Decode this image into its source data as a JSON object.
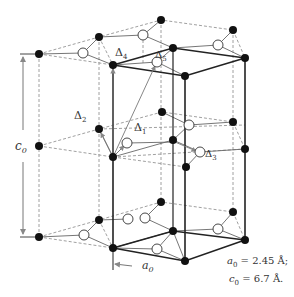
{
  "diagram": {
    "type": "graphite crystal structure (hexagonal unit cell)",
    "labels": {
      "delta1": "Δ",
      "delta1_sub": "1",
      "delta2": "Δ",
      "delta2_sub": "2",
      "delta3": "Δ",
      "delta3_sub": "3",
      "delta4": "Δ",
      "delta4_sub": "4",
      "delta5": "Δ",
      "delta5_sub": "5",
      "c0": "c",
      "c0_sub": "0",
      "a0": "a",
      "a0_sub": "0"
    },
    "constants": {
      "a0_symbol": "a",
      "a0_sub": "0",
      "a0_value": " = 2.45 Å;",
      "c0_symbol": "c",
      "c0_sub": "0",
      "c0_value": " = 6.7 Å."
    },
    "colors": {
      "atom_filled": "#111111",
      "atom_open": "#ffffff",
      "bond": "#555555",
      "cell_edge": "#222222",
      "dashed": "#777777",
      "arrow": "#888888"
    }
  }
}
